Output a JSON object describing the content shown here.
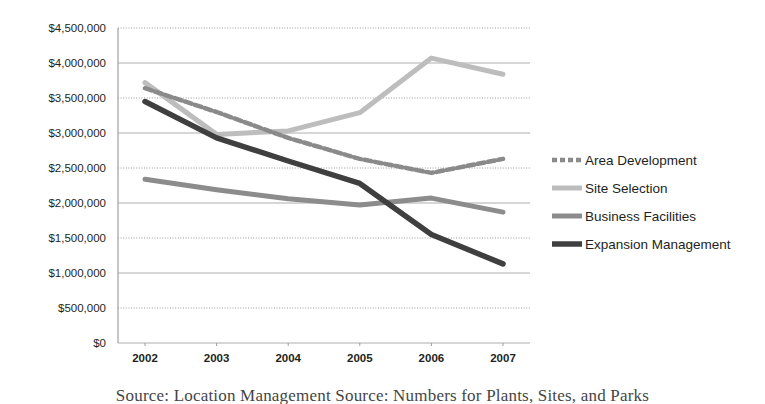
{
  "chart_data": {
    "type": "line",
    "title": "",
    "xlabel": "",
    "ylabel": "",
    "categories": [
      "2002",
      "2003",
      "2004",
      "2005",
      "2006",
      "2007"
    ],
    "ylim": [
      0,
      4500000
    ],
    "ytick_step": 500000,
    "grid": true,
    "legend_position": "right",
    "ytick_labels": [
      "$4,500,000",
      "$4,000,000",
      "$3,500,000",
      "$3,000,000",
      "$2,500,000",
      "$2,000,000",
      "$1,500,000",
      "$1,000,000",
      "$500,000",
      "$0"
    ],
    "series": [
      {
        "name": "Area Development",
        "values": [
          3640000,
          3300000,
          2930000,
          2630000,
          2430000,
          2630000
        ],
        "style": "dotted",
        "color": "#8a8a8a",
        "width": 4.5
      },
      {
        "name": "Site Selection",
        "values": [
          3720000,
          2980000,
          3030000,
          3290000,
          4070000,
          3840000
        ],
        "style": "solid",
        "color": "#bdbdbd",
        "width": 5
      },
      {
        "name": "Business Facilities",
        "values": [
          2340000,
          2190000,
          2060000,
          1970000,
          2070000,
          1870000
        ],
        "style": "solid",
        "color": "#8c8c8c",
        "width": 5
      },
      {
        "name": "Expansion Management",
        "values": [
          3450000,
          2930000,
          2600000,
          2280000,
          1550000,
          1130000
        ],
        "style": "solid",
        "color": "#3f3f3f",
        "width": 5.5
      }
    ]
  },
  "legend": {
    "items": [
      {
        "label": "Area Development"
      },
      {
        "label": "Site Selection"
      },
      {
        "label": "Business Facilities"
      },
      {
        "label": "Expansion Management"
      }
    ]
  },
  "caption": {
    "text": "Source: Location Management Source: Numbers for Plants, Sites, and Parks"
  }
}
